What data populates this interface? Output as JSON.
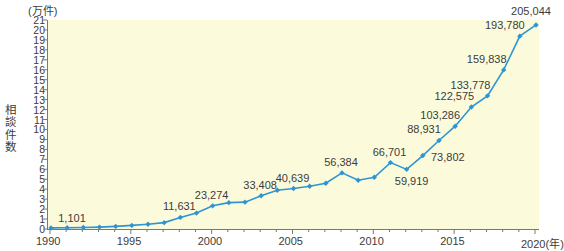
{
  "chart_data": {
    "type": "line",
    "title": "",
    "unit_label": "(万件)",
    "ylabel": "相談件数",
    "xlabel": "(年)",
    "x": [
      1990,
      1991,
      1992,
      1993,
      1994,
      1995,
      1996,
      1997,
      1998,
      1999,
      2000,
      2001,
      2002,
      2003,
      2004,
      2005,
      2006,
      2007,
      2008,
      2009,
      2010,
      2011,
      2012,
      2013,
      2014,
      2015,
      2016,
      2017,
      2018,
      2019,
      2020
    ],
    "values": [
      1101,
      1250,
      1500,
      1900,
      2600,
      3600,
      4800,
      6400,
      11631,
      16000,
      23274,
      26500,
      27000,
      33408,
      39000,
      40639,
      43000,
      46000,
      56384,
      49000,
      52000,
      66701,
      59919,
      73802,
      88931,
      103286,
      122575,
      133778,
      159838,
      193780,
      205044
    ],
    "point_labels": [
      {
        "x": 1990,
        "text": "1,101"
      },
      {
        "x": 1998,
        "text": "11,631"
      },
      {
        "x": 2000,
        "text": "23,274"
      },
      {
        "x": 2003,
        "text": "33,408"
      },
      {
        "x": 2005,
        "text": "40,639"
      },
      {
        "x": 2008,
        "text": "56,384"
      },
      {
        "x": 2011,
        "text": "66,701"
      },
      {
        "x": 2012,
        "text": "59,919"
      },
      {
        "x": 2013,
        "text": "73,802"
      },
      {
        "x": 2014,
        "text": "88,931"
      },
      {
        "x": 2015,
        "text": "103,286"
      },
      {
        "x": 2016,
        "text": "122,575"
      },
      {
        "x": 2017,
        "text": "133,778"
      },
      {
        "x": 2018,
        "text": "159,838"
      },
      {
        "x": 2019,
        "text": "193,780"
      },
      {
        "x": 2020,
        "text": "205,044"
      }
    ],
    "yticks": [
      0,
      1,
      2,
      3,
      4,
      5,
      6,
      7,
      8,
      9,
      10,
      11,
      12,
      13,
      14,
      15,
      16,
      17,
      18,
      19,
      20,
      21
    ],
    "ylim": [
      0,
      21
    ],
    "xticks": [
      1990,
      1995,
      2000,
      2005,
      2010,
      2015,
      2020
    ],
    "xlim": [
      1990,
      2020
    ],
    "grid": false,
    "legend": null,
    "series_color": "#2e95d3",
    "plot_background": "#fbfbdc",
    "axis_color": "#7a7a6a"
  }
}
